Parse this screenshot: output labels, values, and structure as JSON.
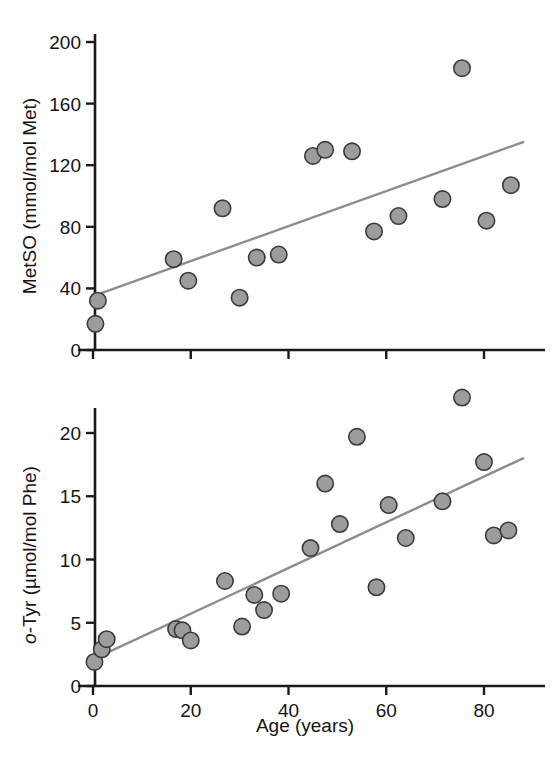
{
  "figure": {
    "title": "",
    "background_color": "#ffffff",
    "marker_color": "#9c9c9c",
    "marker_edge_color": "#3b3b3b",
    "line_color": "#8d8d8d",
    "axis_color": "#1a1a1a"
  },
  "panels": {
    "top": {
      "ylabel": "MetSO (mmol/mol Met)",
      "xlabel": "",
      "y_ticks": [
        "0",
        "40",
        "80",
        "120",
        "160",
        "200"
      ],
      "x_ticks": [
        "0",
        "20",
        "40",
        "60",
        "80"
      ]
    },
    "bottom": {
      "ylabel_italic": "o",
      "ylabel_rest": "-Tyr (µmol/mol Phe)",
      "ylabel": "o-Tyr (µmol/mol Phe)",
      "xlabel": "Age (years)",
      "y_ticks": [
        "0",
        "5",
        "10",
        "15",
        "20"
      ],
      "x_ticks": [
        "0",
        "20",
        "40",
        "60",
        "80"
      ]
    }
  },
  "chart_data": [
    {
      "type": "scatter",
      "title": "",
      "xlabel": "",
      "ylabel": "MetSO (mmol/mol Met)",
      "xlim": [
        0,
        90
      ],
      "ylim": [
        0,
        200
      ],
      "xticks": [
        0,
        20,
        40,
        60,
        80
      ],
      "yticks": [
        0,
        40,
        80,
        120,
        160,
        200
      ],
      "grid": false,
      "legend": null,
      "series": [
        {
          "name": "MetSO vs Age",
          "x": [
            0.5,
            1.0,
            16.5,
            19.5,
            26.5,
            30.0,
            33.5,
            38.0,
            45.0,
            47.5,
            53.0,
            57.5,
            62.5,
            71.5,
            75.5,
            80.5,
            85.5
          ],
          "y": [
            17,
            32,
            59,
            45,
            92,
            34,
            60,
            62,
            126,
            130,
            129,
            77,
            87,
            98,
            183,
            84,
            107
          ]
        }
      ],
      "trendline": {
        "name": "linear fit",
        "x": [
          0,
          88
        ],
        "y": [
          35,
          135
        ]
      }
    },
    {
      "type": "scatter",
      "title": "",
      "xlabel": "Age (years)",
      "ylabel": "o-Tyr (µmol/mol Phe)",
      "xlim": [
        0,
        90
      ],
      "ylim": [
        0,
        23.5
      ],
      "xticks": [
        0,
        20,
        40,
        60,
        80
      ],
      "yticks": [
        0,
        5,
        10,
        15,
        20
      ],
      "grid": false,
      "legend": null,
      "series": [
        {
          "name": "o-Tyr vs Age",
          "x": [
            0.3,
            1.8,
            2.8,
            17.0,
            18.3,
            20.0,
            27.0,
            30.5,
            33.0,
            35.0,
            38.5,
            44.5,
            47.5,
            50.5,
            54.0,
            58.0,
            60.5,
            64.0,
            71.5,
            75.5,
            80.0,
            82.0,
            85.0
          ],
          "y": [
            1.9,
            2.9,
            3.7,
            4.5,
            4.4,
            3.6,
            8.3,
            4.7,
            7.2,
            6.0,
            7.3,
            10.9,
            16.0,
            12.8,
            19.7,
            7.8,
            14.3,
            11.7,
            14.6,
            22.8,
            17.7,
            11.9,
            12.3
          ]
        }
      ],
      "trendline": {
        "name": "linear fit",
        "x": [
          0,
          88
        ],
        "y": [
          2.1,
          18.0
        ]
      }
    }
  ]
}
